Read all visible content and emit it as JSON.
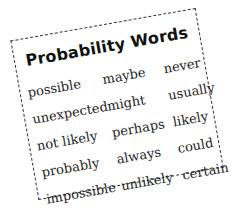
{
  "card": {
    "title": "Probability Words",
    "rows": [
      [
        "possible",
        "maybe",
        "never"
      ],
      [
        "unexpected",
        "might",
        "usually"
      ],
      [
        "not likely",
        "perhaps",
        "likely"
      ],
      [
        "probably",
        "always",
        "could"
      ],
      [
        "impossible",
        "unlikely",
        "certain"
      ]
    ]
  },
  "colors": {
    "text": "#222222",
    "border": "#333333",
    "background": "#ffffff"
  }
}
